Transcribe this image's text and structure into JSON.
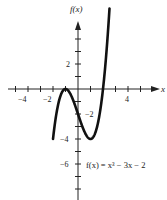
{
  "chart_data": {
    "type": "line",
    "title": "",
    "xlabel": "x",
    "ylabel": "f(x)",
    "function": "x^3 - 3x - 2",
    "annotation": "f(x) = x³ − 3x − 2",
    "xlim": [
      -5,
      5
    ],
    "ylim": [
      -8,
      6
    ],
    "x_ticks": [
      -5,
      -4,
      -3,
      -2,
      -1,
      1,
      2,
      3,
      4,
      5
    ],
    "x_tick_labels": [
      {
        "value": -4,
        "label": "−4"
      },
      {
        "value": -2,
        "label": "−2"
      },
      {
        "value": 4,
        "label": "4"
      }
    ],
    "y_ticks": [
      -8,
      -7,
      -6,
      -5,
      -4,
      -3,
      -2,
      -1,
      1,
      2,
      3,
      4
    ],
    "y_tick_labels": [
      {
        "value": 2,
        "label": "2"
      },
      {
        "value": -2,
        "label": "−2"
      },
      {
        "value": -4,
        "label": "−4"
      },
      {
        "value": -6,
        "label": "−6"
      }
    ],
    "grid": false,
    "series": [
      {
        "name": "f(x) = x^3 - 3x - 2",
        "x": [
          -2.0,
          -1.8,
          -1.6,
          -1.4,
          -1.2,
          -1.0,
          -0.8,
          -0.6,
          -0.4,
          -0.2,
          0.0,
          0.2,
          0.4,
          0.6,
          0.8,
          1.0,
          1.2,
          1.4,
          1.6,
          1.8,
          2.0,
          2.2,
          2.4,
          2.6
        ],
        "y": [
          -4.0,
          -2.43,
          -1.3,
          -0.54,
          -0.13,
          0.0,
          -0.11,
          -0.42,
          -0.86,
          -1.41,
          -2.0,
          -2.59,
          -3.14,
          -3.58,
          -3.89,
          -4.0,
          -3.87,
          -3.46,
          -2.7,
          -1.57,
          0.0,
          2.05,
          4.62,
          7.78
        ]
      }
    ],
    "extrema": [
      {
        "type": "local max",
        "x": -1,
        "y": 0
      },
      {
        "type": "local min",
        "x": 1,
        "y": -4
      }
    ]
  },
  "labels": {
    "y_axis": "f(x)",
    "x_axis": "x",
    "equation": "f(x) = x³ − 3x − 2",
    "tick_neg4": "−4",
    "tick_neg2": "−2",
    "tick_4": "4",
    "ytick_2": "2",
    "ytick_neg2": "−2",
    "ytick_neg4": "−4",
    "ytick_neg6": "−6"
  }
}
